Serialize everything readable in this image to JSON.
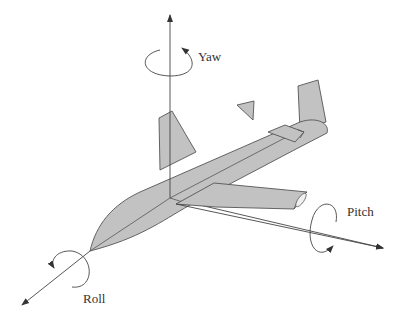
{
  "diagram": {
    "labels": {
      "yaw": "Yaw",
      "pitch": "Pitch",
      "roll": "Roll"
    },
    "colors": {
      "aircraft_fill": "#c2c2c2",
      "outline": "#555555",
      "axis": "#444444",
      "background": "#ffffff"
    },
    "axes": [
      {
        "name": "yaw",
        "direction": "vertical"
      },
      {
        "name": "pitch",
        "direction": "lateral (toward lower right)"
      },
      {
        "name": "roll",
        "direction": "longitudinal (toward lower left)"
      }
    ]
  }
}
